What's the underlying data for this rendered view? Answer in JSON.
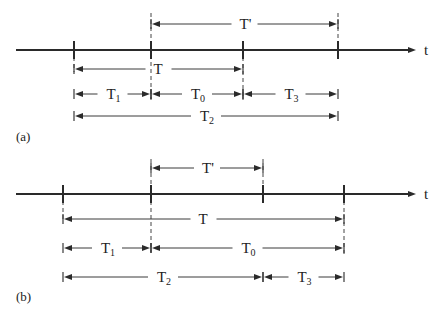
{
  "figure": {
    "width": 441,
    "height": 319,
    "axis_label": "t",
    "colors": {
      "ink": "#2a2a2a",
      "background": "#ffffff"
    }
  },
  "panels": [
    {
      "id": "a",
      "caption": "(a)",
      "caption_pos": [
        16,
        141
      ],
      "axis": {
        "y": 50,
        "x_start": 16,
        "x_end": 416,
        "label_x": 424
      },
      "ticks": [
        74,
        151,
        243,
        338
      ],
      "dashed": [
        {
          "x": 151,
          "y1": 13,
          "y2": 100
        },
        {
          "x": 243,
          "y1": 50,
          "y2": 100
        },
        {
          "x": 338,
          "y1": 13,
          "y2": 50
        },
        {
          "x": 74,
          "y1": 50,
          "y2": 72
        }
      ],
      "intervals": [
        {
          "name": "T'",
          "label": "T'",
          "sub": "",
          "x1": 151,
          "x2": 338,
          "y": 24
        },
        {
          "name": "T",
          "label": "T",
          "sub": "",
          "x1": 74,
          "x2": 243,
          "y": 69
        },
        {
          "name": "T1",
          "label": "T",
          "sub": "1",
          "x1": 74,
          "x2": 151,
          "y": 94
        },
        {
          "name": "T0",
          "label": "T",
          "sub": "0",
          "x1": 151,
          "x2": 243,
          "y": 94
        },
        {
          "name": "T3",
          "label": "T",
          "sub": "3",
          "x1": 243,
          "x2": 338,
          "y": 94
        },
        {
          "name": "T2",
          "label": "T",
          "sub": "2",
          "x1": 74,
          "x2": 338,
          "y": 116
        }
      ]
    },
    {
      "id": "b",
      "caption": "(b)",
      "caption_pos": [
        16,
        301
      ],
      "axis": {
        "y": 194,
        "x_start": 16,
        "x_end": 416,
        "label_x": 424
      },
      "ticks": [
        63,
        151,
        263,
        344
      ],
      "dashed": [
        {
          "x": 151,
          "y1": 159,
          "y2": 252
        },
        {
          "x": 263,
          "y1": 159,
          "y2": 194
        },
        {
          "x": 344,
          "y1": 194,
          "y2": 256
        },
        {
          "x": 63,
          "y1": 194,
          "y2": 222
        }
      ],
      "intervals": [
        {
          "name": "T'",
          "label": "T'",
          "sub": "",
          "x1": 151,
          "x2": 263,
          "y": 168
        },
        {
          "name": "T",
          "label": "T",
          "sub": "",
          "x1": 63,
          "x2": 344,
          "y": 219
        },
        {
          "name": "T1",
          "label": "T",
          "sub": "1",
          "x1": 63,
          "x2": 151,
          "y": 248
        },
        {
          "name": "T0",
          "label": "T",
          "sub": "0",
          "x1": 151,
          "x2": 344,
          "y": 248
        },
        {
          "name": "T2",
          "label": "T",
          "sub": "2",
          "x1": 63,
          "x2": 263,
          "y": 277
        },
        {
          "name": "T3",
          "label": "T",
          "sub": "3",
          "x1": 263,
          "x2": 344,
          "y": 277
        }
      ]
    }
  ]
}
